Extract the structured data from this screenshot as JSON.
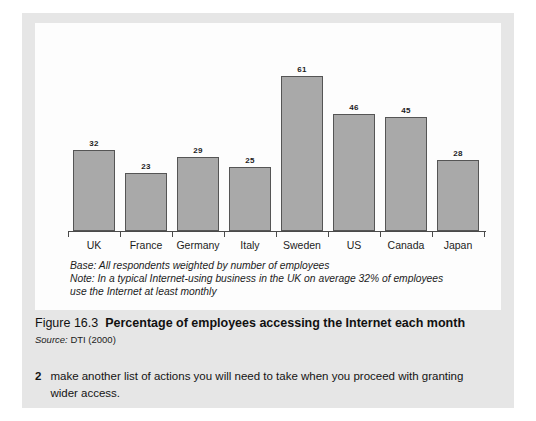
{
  "chart_data": {
    "type": "bar",
    "title": "Percentage of employees accessing the Internet each month",
    "xlabel": "",
    "ylabel": "",
    "ylim": [
      0,
      61
    ],
    "grid": false,
    "legend": "none",
    "categories": [
      "UK",
      "France",
      "Germany",
      "Italy",
      "Sweden",
      "US",
      "Canada",
      "Japan"
    ],
    "values": [
      32,
      23,
      29,
      25,
      61,
      46,
      45,
      28
    ],
    "value_labels": [
      "32",
      "23",
      "29",
      "25",
      "61",
      "46",
      "45",
      "28"
    ],
    "annotations": [
      "Base: All respondents weighted by number of employees",
      "Note: In a typical Internet-using business in the UK on average 32% of employees use the Internet at least monthly"
    ]
  },
  "chart_notes": {
    "base_line": "Base: All respondents weighted by number of employees",
    "note_line_1": "Note: In a typical Internet-using business in the UK on average 32% of employees",
    "note_line_2": "use the Internet at least monthly"
  },
  "caption": {
    "figure_number": "Figure 16.3",
    "figure_title": "Percentage of employees accessing the Internet each month",
    "source_label": "Source:",
    "source_value": "DTI (2000)"
  },
  "body": {
    "item_number": "2",
    "item_text": "make another list of actions you will need to take when you proceed with granting wider access."
  },
  "colors": {
    "page_background": "#e6e6e6",
    "panel_background": "#fdfdfd",
    "bar_fill": "#a9a9a9",
    "bar_border": "#555555",
    "axis": "#4a4a4a",
    "text": "#1c1c1c"
  }
}
